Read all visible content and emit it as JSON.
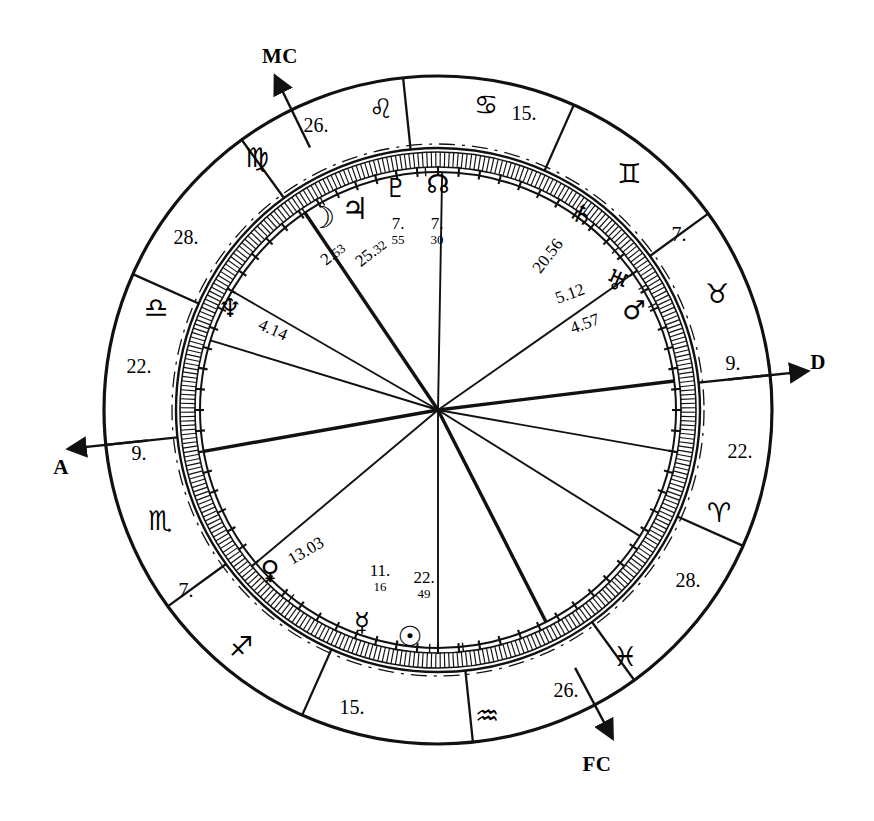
{
  "chart_data": {
    "type": "other",
    "center": {
      "x": 438,
      "y": 410
    },
    "radii": {
      "outer": 334,
      "sign_ring_inner": 262,
      "degree_ring_outer": 258,
      "degree_ring_inner": 243,
      "inner_circle": 238
    },
    "axes": [
      {
        "name": "MC",
        "label": "MC",
        "angle_deg": 116,
        "arrow": "out"
      },
      {
        "name": "Ascendant",
        "label": "A",
        "angle_deg": 186,
        "arrow": "out"
      },
      {
        "name": "Descendant",
        "label": "D",
        "angle_deg": 6,
        "arrow": "out"
      },
      {
        "name": "FC",
        "label": "FC",
        "angle_deg": 298,
        "arrow": "out"
      }
    ],
    "signs": [
      {
        "name": "virgo",
        "glyph": "♍",
        "angle_deg": 139
      },
      {
        "name": "leo",
        "glyph": "♌",
        "angle_deg": 105
      },
      {
        "name": "cancer",
        "glyph": "♋",
        "angle_deg": 77
      },
      {
        "name": "gemini",
        "glyph": "♊",
        "angle_deg": 47
      },
      {
        "name": "taurus",
        "glyph": "♉",
        "angle_deg": 18
      },
      {
        "name": "aries",
        "glyph": "♈",
        "angle_deg": 345
      },
      {
        "name": "pisces",
        "glyph": "♓",
        "angle_deg": 315
      },
      {
        "name": "aquarius",
        "glyph": "♒",
        "angle_deg": 283
      },
      {
        "name": "capricorn-sagittarius",
        "glyph": "♐",
        "angle_deg": 256
      },
      {
        "name": "scorpio",
        "glyph": "♏",
        "angle_deg": 208
      },
      {
        "name": "libra",
        "glyph": "♎",
        "angle_deg": 170
      }
    ],
    "house_cusps": [
      {
        "label": "26.",
        "angle_deg": 124
      },
      {
        "label": "15.",
        "angle_deg": 89
      },
      {
        "label": "7.",
        "angle_deg": 35
      },
      {
        "label": "9.",
        "angle_deg": 7
      },
      {
        "label": "22.",
        "angle_deg": 350
      },
      {
        "label": "28.",
        "angle_deg": 328
      },
      {
        "label": "26.",
        "angle_deg": 297
      },
      {
        "label": "15.",
        "angle_deg": 270
      },
      {
        "label": "7.",
        "angle_deg": 220
      },
      {
        "label": "9.",
        "angle_deg": 190
      },
      {
        "label": "22.",
        "angle_deg": 163
      },
      {
        "label": "28.",
        "angle_deg": 150
      }
    ],
    "planets": [
      {
        "name": "moon",
        "glyph": "☽",
        "deg": "2.",
        "min": "53",
        "angle_deg": 124
      },
      {
        "name": "jupiter",
        "glyph": "♃",
        "deg": "25.",
        "min": "32",
        "angle_deg": 119
      },
      {
        "name": "pluto",
        "glyph": "♇",
        "deg": "7.",
        "min": "55",
        "angle_deg": 100
      },
      {
        "name": "north-node",
        "glyph": "☊",
        "deg": "7.",
        "min": "30",
        "angle_deg": 93
      },
      {
        "name": "saturn",
        "glyph": "♄",
        "deg": "20.",
        "min": "56",
        "angle_deg": 42
      },
      {
        "name": "uranus",
        "glyph": "♅",
        "deg": "5.",
        "min": "12",
        "angle_deg": 31
      },
      {
        "name": "mars",
        "glyph": "♂",
        "deg": "4.",
        "min": "57",
        "angle_deg": 26
      },
      {
        "name": "venus",
        "glyph": "♀",
        "deg": "13.",
        "min": "03",
        "angle_deg": 232
      },
      {
        "name": "mercury",
        "glyph": "☿",
        "deg": "11.",
        "min": "16",
        "angle_deg": 268
      },
      {
        "name": "sun",
        "glyph": "☉",
        "deg": "22.",
        "min": "49",
        "angle_deg": 276
      }
    ]
  },
  "axes": {
    "mc": "MC",
    "asc": "A",
    "desc": "D",
    "fc": "FC"
  },
  "signs": {
    "virgo": "♍",
    "leo": "♌",
    "cancer": "♋",
    "gemini": "♊",
    "taurus": "♉",
    "aries": "♈",
    "pisces": "♓",
    "aquarius": "♒",
    "sagittarius": "♐",
    "scorpio": "♏",
    "libra": "♎"
  },
  "cusps": {
    "c1": "26.",
    "c2": "15.",
    "c3": "7.",
    "c4": "9.",
    "c5": "22.",
    "c6": "28.",
    "c7": "26.",
    "c8": "15.",
    "c9": "7.",
    "c10": "9.",
    "c11": "22.",
    "c12": "28."
  },
  "planets": {
    "moon": {
      "glyph": "☽",
      "deg": "2.",
      "min": "53"
    },
    "jupiter": {
      "glyph": "♃",
      "deg": "25.",
      "min": "32"
    },
    "pluto": {
      "glyph": "♇",
      "deg": "7.",
      "min": "55"
    },
    "north_node": {
      "glyph": "☊",
      "deg": "7.",
      "min": "30"
    },
    "saturn": {
      "glyph": "♄",
      "deg": "20.56"
    },
    "uranus": {
      "glyph": "♅",
      "deg": "5.12"
    },
    "mars": {
      "glyph": "♂",
      "deg": "4.57"
    },
    "venus": {
      "glyph": "♀",
      "deg": "13.03"
    },
    "mercury": {
      "glyph": "☿",
      "deg": "11.",
      "min": "16"
    },
    "sun": {
      "glyph": "☉",
      "deg": "22.",
      "min": "49"
    }
  },
  "colors": {
    "ink": "#111111",
    "paper": "#ffffff"
  }
}
